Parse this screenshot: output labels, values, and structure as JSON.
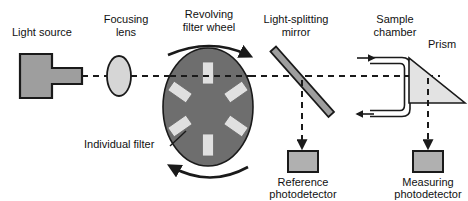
{
  "figure": {
    "width": 468,
    "height": 201,
    "background": "#ffffff"
  },
  "colors": {
    "outline": "#1a1a1a",
    "component_fill": "#9e9e9e",
    "filter_fill": "#e0e0e0",
    "lens_fill": "#d6d6d6",
    "prism_fill": "#e3e3e3",
    "detector_fill": "#b0b0b0",
    "wheel_fill": "#6e6e6e",
    "beam": "#1a1a1a",
    "text": "#111111"
  },
  "labels": {
    "light_source": "Light source",
    "focusing_lens_line1": "Focusing",
    "focusing_lens_line2": "lens",
    "filter_wheel_line1": "Revolving",
    "filter_wheel_line2": "filter wheel",
    "splitting_mirror_line1": "Light-splitting",
    "splitting_mirror_line2": "mirror",
    "sample_chamber_line1": "Sample",
    "sample_chamber_line2": "chamber",
    "prism": "Prism",
    "individual_filter": "Individual filter",
    "reference_detector_line1": "Reference",
    "reference_detector_line2": "photodetector",
    "measuring_detector_line1": "Measuring",
    "measuring_detector_line2": "photodetector"
  },
  "components": [
    {
      "id": "light-source",
      "name": "Light source",
      "shape": "t-shape-lamp",
      "fill": "#9e9e9e",
      "x": 20,
      "y": 54,
      "width": 62,
      "height": 44
    },
    {
      "id": "focusing-lens",
      "name": "Focusing lens",
      "shape": "ellipse",
      "fill": "#d6d6d6",
      "cx": 119,
      "cy": 76,
      "rx": 12,
      "ry": 20
    },
    {
      "id": "revolving-filter-wheel",
      "name": "Revolving filter wheel",
      "shape": "ellipse",
      "fill": "#6e6e6e",
      "cx": 208,
      "cy": 107,
      "rx": 45,
      "ry": 59,
      "filter_count": 6
    },
    {
      "id": "light-splitting-mirror",
      "name": "Light-splitting mirror",
      "shape": "diagonal-bar",
      "fill": "#9e9e9e",
      "x1": 272,
      "y1": 54,
      "x2": 330,
      "y2": 120
    },
    {
      "id": "sample-chamber",
      "name": "Sample chamber",
      "shape": "c-bracket-cuvette",
      "x": 370,
      "y": 52,
      "width": 42,
      "height": 68
    },
    {
      "id": "prism",
      "name": "Prism",
      "shape": "right-triangle",
      "fill": "#e3e3e3",
      "x": 409,
      "y": 58,
      "width": 56,
      "height": 45
    },
    {
      "id": "reference-photodetector",
      "name": "Reference photodetector",
      "shape": "rectangle",
      "fill": "#b0b0b0",
      "x": 288,
      "y": 151,
      "width": 30,
      "height": 21
    },
    {
      "id": "measuring-photodetector",
      "name": "Measuring photodetector",
      "shape": "rectangle",
      "fill": "#b0b0b0",
      "x": 413,
      "y": 151,
      "width": 30,
      "height": 21
    }
  ],
  "filters": [
    {
      "index": 0,
      "cx": 208,
      "cy": 73,
      "angle": 0,
      "w": 11,
      "h": 22
    },
    {
      "index": 1,
      "cx": 180,
      "cy": 92,
      "angle": -55,
      "w": 11,
      "h": 22
    },
    {
      "index": 2,
      "cx": 236,
      "cy": 92,
      "angle": 55,
      "w": 11,
      "h": 22
    },
    {
      "index": 3,
      "cx": 180,
      "cy": 126,
      "angle": -125,
      "w": 11,
      "h": 22
    },
    {
      "index": 4,
      "cx": 236,
      "cy": 126,
      "angle": 125,
      "w": 11,
      "h": 22
    },
    {
      "index": 5,
      "cx": 208,
      "cy": 145,
      "angle": 0,
      "w": 11,
      "h": 22
    }
  ],
  "beam_paths": [
    {
      "id": "source-to-lens",
      "style": "dashed",
      "from": [
        82,
        76
      ],
      "to": [
        107,
        76
      ]
    },
    {
      "id": "lens-to-wheel",
      "style": "dashed",
      "from": [
        131,
        76
      ],
      "to": [
        168,
        76
      ]
    },
    {
      "id": "wheel-to-mirror",
      "style": "dashed",
      "from": [
        250,
        76
      ],
      "to": [
        305,
        76
      ]
    },
    {
      "id": "mirror-to-sample",
      "style": "dashed",
      "from": [
        305,
        76
      ],
      "to": [
        437,
        76
      ]
    },
    {
      "id": "mirror-to-reference-detector",
      "style": "dashed-arrow",
      "from": [
        302,
        80
      ],
      "to": [
        302,
        148
      ]
    },
    {
      "id": "prism-to-measuring-detector",
      "style": "dashed-arrow",
      "from": [
        428,
        78
      ],
      "to": [
        428,
        148
      ]
    }
  ],
  "rotation_arrows": [
    {
      "id": "wheel-rotation-top",
      "direction": "clockwise-right",
      "description": "arc arrow above wheel pointing right"
    },
    {
      "id": "wheel-rotation-bottom",
      "direction": "clockwise-left",
      "description": "arc arrow below wheel pointing left"
    }
  ],
  "flow_arrows": [
    {
      "id": "sample-inlet-arrow",
      "direction": "right",
      "x": 358,
      "y": 58
    },
    {
      "id": "sample-outlet-arrow",
      "direction": "left",
      "x": 358,
      "y": 114
    }
  ],
  "leader_lines": [
    {
      "id": "individual-filter-leader",
      "from": [
        168,
        146
      ],
      "to": [
        185,
        132
      ]
    }
  ]
}
